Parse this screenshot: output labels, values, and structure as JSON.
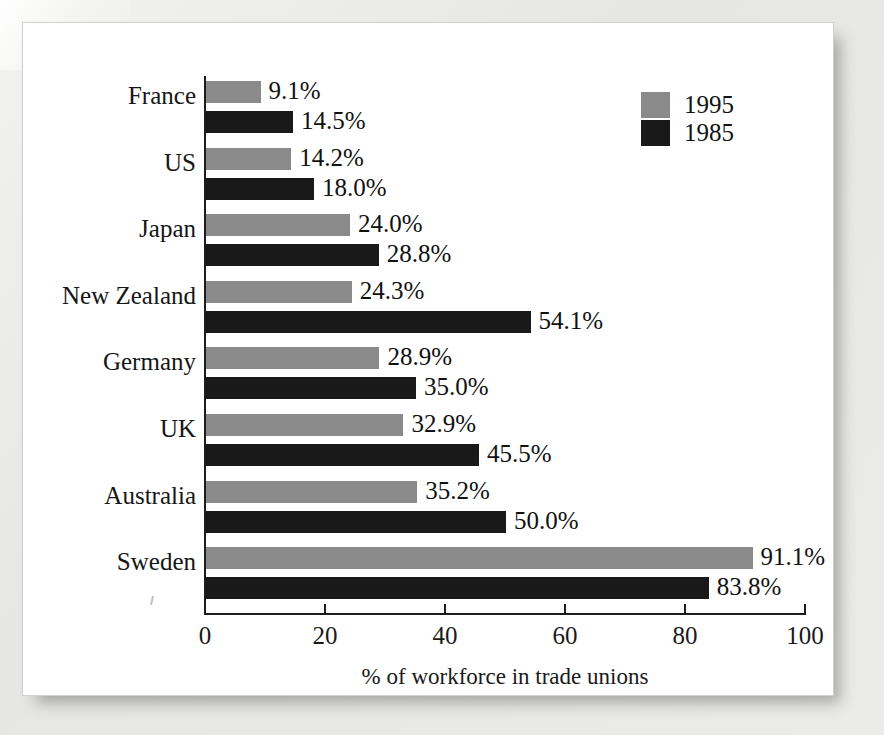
{
  "figure": {
    "background_color": "#ffffff",
    "page_color": "#e9e9e7"
  },
  "legend": {
    "position": "top-right",
    "entries": [
      {
        "label": "1995",
        "color": "#8a8a8a",
        "swatch_name": "legend-swatch-1995"
      },
      {
        "label": "1985",
        "color": "#191919",
        "swatch_name": "legend-swatch-1985"
      }
    ]
  },
  "axis": {
    "x_title": "% of workforce in trade unions",
    "x_ticks": [
      "0",
      "20",
      "40",
      "60",
      "80",
      "100"
    ],
    "x_min": 0,
    "x_max": 100
  },
  "chart_data": {
    "type": "bar",
    "orientation": "horizontal",
    "title": "",
    "subtitle": "",
    "xlabel": "% of workforce in trade unions",
    "ylabel": "",
    "xlim": [
      0,
      100
    ],
    "xticks": [
      0,
      20,
      40,
      60,
      80,
      100
    ],
    "grid": false,
    "legend_position": "top-right",
    "categories": [
      "France",
      "US",
      "Japan",
      "New Zealand",
      "Germany",
      "UK",
      "Australia",
      "Sweden"
    ],
    "series": [
      {
        "name": "1995",
        "color": "#8a8a8a",
        "values": [
          9.1,
          14.2,
          24.0,
          24.3,
          28.9,
          32.9,
          35.2,
          91.1
        ],
        "labels": [
          "9.1%",
          "14.2%",
          "24.0%",
          "24.3%",
          "28.9%",
          "32.9%",
          "35.2%",
          "91.1%"
        ]
      },
      {
        "name": "1985",
        "color": "#191919",
        "values": [
          14.5,
          18.0,
          28.8,
          54.1,
          35.0,
          45.5,
          50.0,
          83.8
        ],
        "labels": [
          "14.5%",
          "18.0%",
          "28.8%",
          "54.1%",
          "35.0%",
          "45.5%",
          "50.0%",
          "83.8%"
        ]
      }
    ]
  }
}
